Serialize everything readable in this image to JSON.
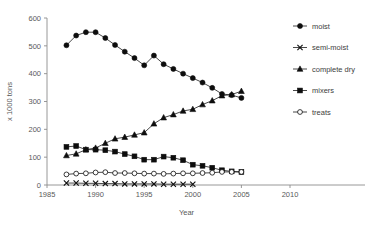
{
  "chart_data": {
    "type": "line",
    "title": "",
    "xlabel": "Year",
    "ylabel": "x 1000 tons",
    "xlim": [
      1985,
      2010
    ],
    "ylim": [
      0,
      600
    ],
    "xticks": [
      1985,
      1990,
      1995,
      2000,
      2005,
      2010
    ],
    "yticks": [
      0,
      100,
      200,
      300,
      400,
      500,
      600
    ],
    "grid": false,
    "legend_position": "right",
    "series": [
      {
        "name": "moist",
        "marker": "filled-circle",
        "x": [
          1987,
          1988,
          1989,
          1990,
          1991,
          1992,
          1993,
          1994,
          1995,
          1996,
          1997,
          1998,
          1999,
          2000,
          2001,
          2002,
          2003,
          2004,
          2005
        ],
        "values": [
          502,
          537,
          549,
          549,
          528,
          503,
          479,
          456,
          430,
          465,
          434,
          417,
          400,
          384,
          368,
          349,
          327,
          323,
          313
        ]
      },
      {
        "name": "semi-moist",
        "marker": "x",
        "x": [
          1987,
          1988,
          1989,
          1990,
          1991,
          1992,
          1993,
          1994,
          1995,
          1996,
          1997,
          1998,
          1999,
          2000
        ],
        "values": [
          7,
          7,
          6,
          6,
          5,
          5,
          4,
          4,
          4,
          4,
          3,
          3,
          3,
          3
        ]
      },
      {
        "name": "complete dry",
        "marker": "filled-triangle",
        "x": [
          1987,
          1988,
          1989,
          1990,
          1991,
          1992,
          1993,
          1994,
          1995,
          1996,
          1997,
          1998,
          1999,
          2000,
          2001,
          2002,
          2003,
          2004,
          2005
        ],
        "values": [
          106,
          112,
          127,
          133,
          150,
          166,
          172,
          180,
          188,
          220,
          242,
          253,
          266,
          272,
          289,
          303,
          321,
          325,
          337
        ]
      },
      {
        "name": "mixers",
        "marker": "filled-square",
        "x": [
          1987,
          1988,
          1989,
          1990,
          1991,
          1992,
          1993,
          1994,
          1995,
          1996,
          1997,
          1998,
          1999,
          2000,
          2001,
          2002,
          2003,
          2004,
          2005
        ],
        "values": [
          137,
          140,
          127,
          127,
          125,
          120,
          111,
          103,
          91,
          91,
          102,
          98,
          89,
          73,
          69,
          62,
          53,
          49,
          47
        ]
      },
      {
        "name": "treats",
        "marker": "open-circle",
        "x": [
          1987,
          1988,
          1989,
          1990,
          1991,
          1992,
          1993,
          1994,
          1995,
          1996,
          1997,
          1998,
          1999,
          2000,
          2001,
          2002,
          2003,
          2004,
          2005
        ],
        "values": [
          38,
          41,
          42,
          45,
          46,
          43,
          43,
          42,
          41,
          41,
          40,
          41,
          42,
          42,
          43,
          44,
          47,
          47,
          47
        ]
      }
    ]
  },
  "legend": {
    "entries": [
      {
        "label": "moist",
        "marker": "filled-circle"
      },
      {
        "label": "semi-moist",
        "marker": "x"
      },
      {
        "label": "complete dry",
        "marker": "filled-triangle"
      },
      {
        "label": "mixers",
        "marker": "filled-square"
      },
      {
        "label": "treats",
        "marker": "open-circle"
      }
    ]
  }
}
